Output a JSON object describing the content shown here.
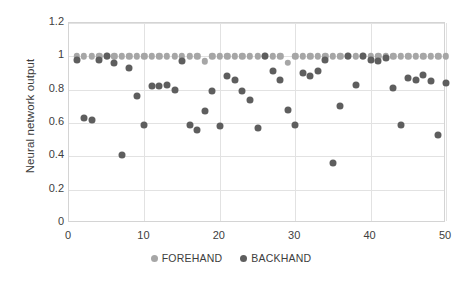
{
  "chart_data": {
    "type": "scatter",
    "title": "",
    "xlabel": "",
    "ylabel": "Neural network output",
    "xlim": [
      0,
      50
    ],
    "ylim": [
      0,
      1.2
    ],
    "grid": true,
    "legend_position": "bottom",
    "y_ticks": [
      "0",
      "0.2",
      "0.4",
      "0.6",
      "0.8",
      "1",
      "1.2"
    ],
    "y_tick_values": [
      0,
      0.2,
      0.4,
      0.6,
      0.8,
      1,
      1.2
    ],
    "x_ticks": [
      "0",
      "10",
      "20",
      "30",
      "40",
      "50"
    ],
    "x_tick_values": [
      0,
      10,
      20,
      30,
      40,
      50
    ],
    "series": [
      {
        "name": "FOREHAND",
        "color": "#a6a6a6",
        "marker": "circle",
        "x": [
          1,
          2,
          3,
          4,
          5,
          6,
          7,
          8,
          9,
          10,
          11,
          12,
          13,
          14,
          15,
          16,
          17,
          18,
          19,
          20,
          21,
          22,
          23,
          24,
          25,
          26,
          27,
          28,
          29,
          30,
          31,
          32,
          33,
          34,
          35,
          36,
          37,
          38,
          39,
          40,
          41,
          42,
          43,
          44,
          45,
          46,
          47,
          48,
          49,
          50
        ],
        "values": [
          1.0,
          1.0,
          1.0,
          1.0,
          1.0,
          1.0,
          1.0,
          1.0,
          1.0,
          1.0,
          1.0,
          1.0,
          1.0,
          1.0,
          1.0,
          1.0,
          1.0,
          0.97,
          1.0,
          1.0,
          1.0,
          1.0,
          1.0,
          1.0,
          1.0,
          1.0,
          1.0,
          1.0,
          0.96,
          1.0,
          1.0,
          1.0,
          1.0,
          1.0,
          1.0,
          1.0,
          1.0,
          1.0,
          1.0,
          1.0,
          1.0,
          1.0,
          1.0,
          1.0,
          1.0,
          1.0,
          1.0,
          1.0,
          1.0,
          1.0
        ]
      },
      {
        "name": "BACKHAND",
        "color": "#5e5e5e",
        "marker": "circle",
        "x": [
          1,
          2,
          3,
          4,
          5,
          6,
          7,
          8,
          9,
          10,
          11,
          12,
          13,
          14,
          15,
          16,
          17,
          18,
          19,
          20,
          21,
          22,
          23,
          24,
          25,
          26,
          27,
          28,
          29,
          30,
          31,
          32,
          33,
          34,
          35,
          36,
          37,
          38,
          39,
          40,
          41,
          42,
          43,
          44,
          45,
          46,
          47,
          48,
          49,
          50
        ],
        "values": [
          0.98,
          0.63,
          0.62,
          0.98,
          1.0,
          0.96,
          0.41,
          0.93,
          0.76,
          0.59,
          0.82,
          0.82,
          0.83,
          0.8,
          0.97,
          0.59,
          0.56,
          0.67,
          0.79,
          0.58,
          0.88,
          0.86,
          0.79,
          0.74,
          0.57,
          1.0,
          0.91,
          0.86,
          0.68,
          0.59,
          0.9,
          0.88,
          0.91,
          0.98,
          0.36,
          0.7,
          1.0,
          0.83,
          1.0,
          0.98,
          0.97,
          0.99,
          0.81,
          0.59,
          0.87,
          0.86,
          0.89,
          0.85,
          0.53,
          0.84
        ]
      }
    ]
  },
  "legend": {
    "entries": [
      {
        "label": "FOREHAND"
      },
      {
        "label": "BACKHAND"
      }
    ]
  },
  "axes": {
    "y_title": "Neural network output"
  }
}
